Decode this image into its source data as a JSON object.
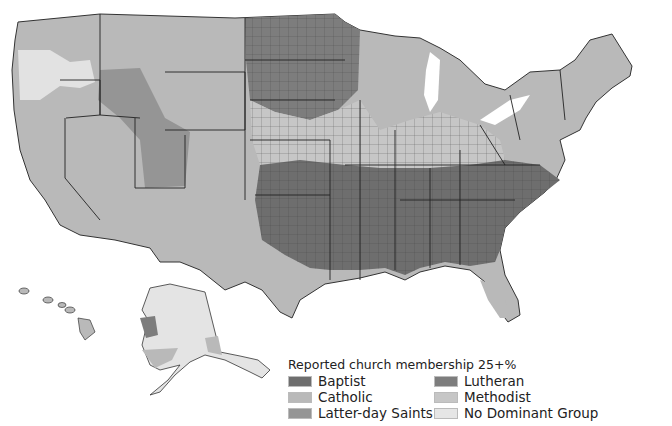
{
  "title": "Reported church membership 25+%",
  "legend": {
    "title": "Reported church membership 25+%",
    "items": [
      {
        "label": "Baptist",
        "color": "#6e6e6e"
      },
      {
        "label": "Catholic",
        "color": "#b9b9b9"
      },
      {
        "label": "Latter-day Saints",
        "color": "#959595"
      },
      {
        "label": "Lutheran",
        "color": "#7d7d7d"
      },
      {
        "label": "Methodist",
        "color": "#c6c6c6"
      },
      {
        "label": "No Dominant Group",
        "color": "#e6e6e6"
      }
    ]
  },
  "map": {
    "description": "U.S. counties shaded by dominant reported church membership",
    "regions": [
      {
        "name": "Pacific Northwest",
        "dominant": "Catholic / No Dominant Group"
      },
      {
        "name": "Mountain West (Utah, Idaho)",
        "dominant": "Latter-day Saints"
      },
      {
        "name": "Upper Midwest (Dakotas, Minnesota)",
        "dominant": "Lutheran"
      },
      {
        "name": "Northeast & Great Lakes",
        "dominant": "Catholic"
      },
      {
        "name": "Midwest (Ohio, Indiana, Iowa)",
        "dominant": "Methodist"
      },
      {
        "name": "South",
        "dominant": "Baptist"
      },
      {
        "name": "Southwest & Texas border",
        "dominant": "Catholic"
      },
      {
        "name": "Alaska",
        "dominant": "No Dominant Group"
      },
      {
        "name": "Hawaii",
        "dominant": "Catholic"
      }
    ]
  }
}
